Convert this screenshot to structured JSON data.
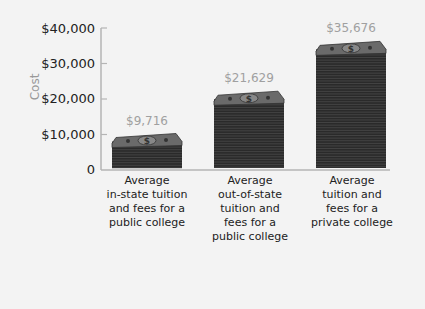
{
  "chart_data": {
    "type": "bar",
    "title": "",
    "xlabel": "",
    "ylabel": "Cost",
    "ylim": [
      0,
      40000
    ],
    "yticks": [
      "0",
      "$10,000",
      "$20,000",
      "$30,000",
      "$40,000"
    ],
    "categories": [
      "Average in-state tuition and fees for a public college",
      "Average out-of-state tuition and fees for a public college",
      "Average tuition and fees for a private college"
    ],
    "category_lines": [
      "Average\nin-state tuition\nand fees for a\npublic college",
      "Average\nout-of-state\ntuition and\nfees for a\npublic college",
      "Average\ntuition and\nfees for a\nprivate college"
    ],
    "values": [
      9716,
      21629,
      35676
    ],
    "value_labels": [
      "$9,716",
      "$21,629",
      "$35,676"
    ],
    "bar_style": "stacked dollar bills",
    "grid": false,
    "legend": null
  },
  "colors": {
    "background": "#f3f3f3",
    "axis": "#b5b5b5",
    "bill_dark": "#2a2a2a",
    "bill_face": "#6a6a6a",
    "value_label": "#a0a0a0",
    "ylabel": "#999999"
  }
}
